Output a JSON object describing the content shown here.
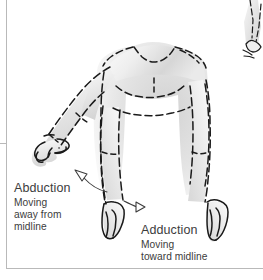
{
  "page": {
    "background_color": "#ffffff",
    "rule_color": "#b9b9b9",
    "text_color": "#3c3c3c",
    "body_fill_light": "#f2f2f2",
    "body_fill_mid": "#d8d8d8",
    "outline_color": "#1a1a1a"
  },
  "labels": {
    "abduction": {
      "term": "Abduction",
      "line1": "Moving",
      "line2": "away from",
      "line3": "midline"
    },
    "adduction": {
      "term": "Adduction",
      "line1": "Moving",
      "line2": "toward midline"
    }
  },
  "annotations": {
    "abduction_arrow": "arrow pointing up-left toward abducted arm",
    "adduction_arrow": "arrow pointing right toward arm at side"
  },
  "figure": {
    "partial_figure_right": "cropped fragment of adjacent figure at top right edge"
  }
}
